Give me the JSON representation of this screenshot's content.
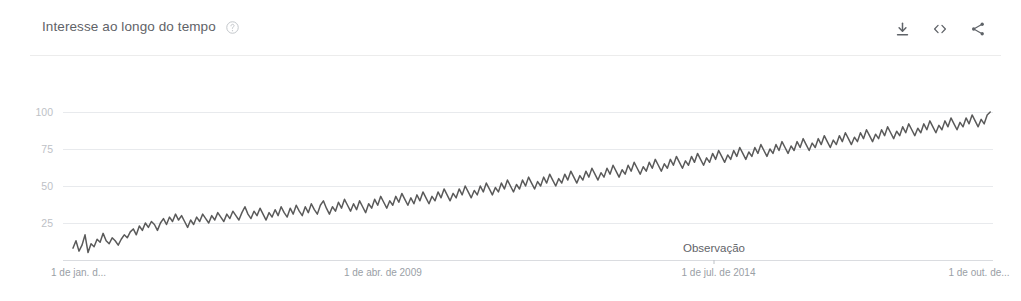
{
  "header": {
    "title": "Interesse ao longo do tempo",
    "help_icon": "help-circle-icon",
    "actions": [
      {
        "name": "download-icon",
        "label": "Download"
      },
      {
        "name": "embed-icon",
        "label": "Embed"
      },
      {
        "name": "share-icon",
        "label": "Share"
      }
    ]
  },
  "chart_data": {
    "type": "line",
    "title": "Interesse ao longo do tempo",
    "xlabel": "",
    "ylabel": "",
    "ylim": [
      0,
      100
    ],
    "yticks": [
      25,
      50,
      75,
      100
    ],
    "ytick_labels": [
      "25",
      "50",
      "75",
      "100"
    ],
    "grid": true,
    "legend": null,
    "xtick_labels": [
      "1 de jan. d...",
      "1 de abr. de 2009",
      "1 de jul. de 2014",
      "1 de out. de..."
    ],
    "xtick_positions": [
      0,
      0.315,
      0.678,
      0.965
    ],
    "annotations": [
      {
        "text": "Observação",
        "x_frac": 0.7,
        "y_frac": 1.0
      }
    ],
    "series": [
      {
        "name": "Interesse",
        "color": "#5a5a5a",
        "values": [
          8,
          13,
          6,
          10,
          17,
          5,
          11,
          9,
          14,
          12,
          18,
          13,
          11,
          15,
          13,
          10,
          14,
          17,
          15,
          19,
          21,
          17,
          23,
          20,
          25,
          22,
          26,
          24,
          20,
          25,
          28,
          24,
          29,
          26,
          31,
          27,
          30,
          26,
          22,
          27,
          24,
          29,
          26,
          31,
          28,
          25,
          30,
          27,
          32,
          29,
          26,
          31,
          28,
          33,
          30,
          27,
          32,
          36,
          31,
          28,
          33,
          30,
          35,
          31,
          27,
          32,
          29,
          34,
          30,
          36,
          32,
          29,
          35,
          31,
          37,
          33,
          30,
          36,
          32,
          38,
          34,
          31,
          37,
          40,
          35,
          31,
          36,
          33,
          39,
          35,
          41,
          37,
          33,
          38,
          34,
          40,
          36,
          32,
          38,
          35,
          41,
          37,
          43,
          39,
          35,
          40,
          37,
          43,
          39,
          45,
          41,
          37,
          42,
          38,
          44,
          40,
          46,
          42,
          38,
          43,
          40,
          46,
          42,
          48,
          44,
          40,
          45,
          42,
          48,
          44,
          50,
          46,
          42,
          47,
          44,
          50,
          46,
          52,
          48,
          44,
          49,
          46,
          52,
          48,
          54,
          50,
          46,
          51,
          48,
          54,
          50,
          56,
          52,
          48,
          53,
          50,
          56,
          52,
          58,
          54,
          50,
          55,
          52,
          58,
          54,
          60,
          56,
          52,
          57,
          54,
          60,
          56,
          62,
          58,
          54,
          59,
          56,
          62,
          58,
          64,
          60,
          56,
          61,
          58,
          64,
          60,
          66,
          62,
          58,
          63,
          60,
          66,
          62,
          68,
          64,
          60,
          65,
          62,
          68,
          64,
          70,
          66,
          62,
          67,
          64,
          70,
          66,
          72,
          68,
          64,
          69,
          66,
          72,
          68,
          74,
          70,
          66,
          71,
          68,
          74,
          70,
          76,
          72,
          68,
          73,
          70,
          76,
          72,
          78,
          74,
          70,
          75,
          72,
          78,
          74,
          80,
          76,
          72,
          77,
          74,
          80,
          76,
          82,
          78,
          74,
          79,
          76,
          82,
          78,
          84,
          80,
          76,
          81,
          78,
          84,
          80,
          86,
          82,
          78,
          83,
          80,
          86,
          82,
          88,
          84,
          80,
          85,
          82,
          88,
          84,
          90,
          86,
          82,
          87,
          84,
          90,
          86,
          92,
          88,
          84,
          89,
          86,
          92,
          88,
          94,
          90,
          86,
          91,
          88,
          94,
          90,
          96,
          92,
          88,
          93,
          90,
          96,
          92,
          98,
          94,
          90,
          95,
          92,
          98,
          100
        ]
      }
    ]
  }
}
